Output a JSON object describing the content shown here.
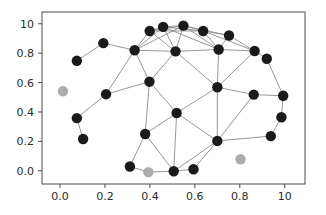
{
  "chart_data": {
    "type": "scatter",
    "title": "",
    "xlabel": "",
    "ylabel": "",
    "xlim": [
      -0.08,
      1.09
    ],
    "ylim": [
      -0.09,
      1.08
    ],
    "grid": false,
    "legend": null,
    "xticks": [
      0.0,
      0.2,
      0.4,
      0.6,
      0.8,
      1.0
    ],
    "xtick_labels": [
      "0.0",
      "0.2",
      "0.4",
      "0.6",
      "0.8",
      "10"
    ],
    "yticks": [
      0.0,
      0.2,
      0.4,
      0.6,
      0.8,
      1.0
    ],
    "ytick_labels": [
      "0.0",
      "0.2",
      "0.4",
      "0.6",
      "0.8",
      "10"
    ],
    "node_color_connected": "#1a1a1a",
    "node_color_isolated": "#adadad",
    "edge_color": "#8c8c8c",
    "frame_color": "#4d4d4d",
    "node_radius_px": 5.2,
    "nodes": [
      {
        "id": 0,
        "x": 0.075,
        "y": 0.748,
        "state": "connected"
      },
      {
        "id": 1,
        "x": 0.193,
        "y": 0.868,
        "state": "connected"
      },
      {
        "id": 2,
        "x": 0.332,
        "y": 0.82,
        "state": "connected"
      },
      {
        "id": 3,
        "x": 0.399,
        "y": 0.951,
        "state": "connected"
      },
      {
        "id": 4,
        "x": 0.459,
        "y": 0.979,
        "state": "connected"
      },
      {
        "id": 5,
        "x": 0.549,
        "y": 0.987,
        "state": "connected"
      },
      {
        "id": 6,
        "x": 0.637,
        "y": 0.951,
        "state": "connected"
      },
      {
        "id": 7,
        "x": 0.752,
        "y": 0.92,
        "state": "connected"
      },
      {
        "id": 8,
        "x": 0.514,
        "y": 0.812,
        "state": "connected"
      },
      {
        "id": 9,
        "x": 0.706,
        "y": 0.825,
        "state": "connected"
      },
      {
        "id": 10,
        "x": 0.866,
        "y": 0.815,
        "state": "connected"
      },
      {
        "id": 11,
        "x": 0.92,
        "y": 0.762,
        "state": "connected"
      },
      {
        "id": 12,
        "x": 0.398,
        "y": 0.606,
        "state": "connected"
      },
      {
        "id": 13,
        "x": 0.205,
        "y": 0.521,
        "state": "connected"
      },
      {
        "id": 14,
        "x": 0.7,
        "y": 0.568,
        "state": "connected"
      },
      {
        "id": 15,
        "x": 0.862,
        "y": 0.518,
        "state": "connected"
      },
      {
        "id": 16,
        "x": 0.993,
        "y": 0.51,
        "state": "connected"
      },
      {
        "id": 17,
        "x": 0.075,
        "y": 0.358,
        "state": "connected"
      },
      {
        "id": 18,
        "x": 0.519,
        "y": 0.393,
        "state": "connected"
      },
      {
        "id": 19,
        "x": 0.985,
        "y": 0.364,
        "state": "connected"
      },
      {
        "id": 20,
        "x": 0.379,
        "y": 0.25,
        "state": "connected"
      },
      {
        "id": 21,
        "x": 0.103,
        "y": 0.216,
        "state": "connected"
      },
      {
        "id": 22,
        "x": 0.7,
        "y": 0.203,
        "state": "connected"
      },
      {
        "id": 23,
        "x": 0.938,
        "y": 0.236,
        "state": "connected"
      },
      {
        "id": 24,
        "x": 0.311,
        "y": 0.029,
        "state": "connected"
      },
      {
        "id": 25,
        "x": 0.506,
        "y": -0.003,
        "state": "connected"
      },
      {
        "id": 26,
        "x": 0.594,
        "y": 0.01,
        "state": "connected"
      },
      {
        "id": 27,
        "x": 0.013,
        "y": 0.541,
        "state": "isolated"
      },
      {
        "id": 28,
        "x": 0.393,
        "y": -0.009,
        "state": "isolated"
      },
      {
        "id": 29,
        "x": 0.803,
        "y": 0.078,
        "state": "isolated"
      }
    ],
    "edges": [
      [
        0,
        1
      ],
      [
        1,
        2
      ],
      [
        2,
        3
      ],
      [
        2,
        4
      ],
      [
        2,
        5
      ],
      [
        2,
        8
      ],
      [
        2,
        12
      ],
      [
        2,
        13
      ],
      [
        3,
        4
      ],
      [
        3,
        5
      ],
      [
        3,
        6
      ],
      [
        3,
        8
      ],
      [
        4,
        5
      ],
      [
        4,
        6
      ],
      [
        4,
        8
      ],
      [
        4,
        9
      ],
      [
        5,
        6
      ],
      [
        5,
        7
      ],
      [
        5,
        8
      ],
      [
        5,
        9
      ],
      [
        6,
        7
      ],
      [
        6,
        9
      ],
      [
        6,
        10
      ],
      [
        7,
        9
      ],
      [
        7,
        10
      ],
      [
        8,
        9
      ],
      [
        8,
        12
      ],
      [
        8,
        14
      ],
      [
        9,
        10
      ],
      [
        9,
        14
      ],
      [
        10,
        11
      ],
      [
        10,
        14
      ],
      [
        11,
        16
      ],
      [
        12,
        13
      ],
      [
        12,
        18
      ],
      [
        12,
        20
      ],
      [
        13,
        17
      ],
      [
        14,
        15
      ],
      [
        14,
        18
      ],
      [
        14,
        22
      ],
      [
        15,
        16
      ],
      [
        15,
        22
      ],
      [
        16,
        19
      ],
      [
        17,
        21
      ],
      [
        18,
        20
      ],
      [
        18,
        22
      ],
      [
        18,
        25
      ],
      [
        19,
        23
      ],
      [
        20,
        24
      ],
      [
        20,
        25
      ],
      [
        22,
        23
      ],
      [
        22,
        25
      ],
      [
        22,
        26
      ],
      [
        24,
        28
      ],
      [
        25,
        26
      ],
      [
        25,
        28
      ]
    ]
  }
}
